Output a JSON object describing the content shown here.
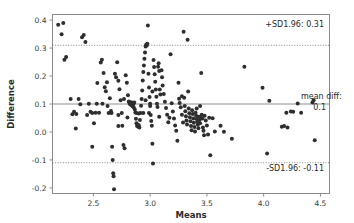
{
  "chart": {
    "type_label": "bland-altman-plot",
    "background": "#ffffff",
    "point_color": "#2e2e2e",
    "line_color": "#8f8f8f"
  },
  "axes": {
    "x_title": "Means",
    "y_title": "Difference",
    "x_ticks": [
      "2.5",
      "3.0",
      "3.5",
      "4.0",
      "4.5"
    ],
    "y_ticks": [
      "0.4",
      "0.3",
      "0.2",
      "0.1",
      "0.0",
      "-0.1",
      "-0.2"
    ]
  },
  "annotations": {
    "upper_limit": "+SD1.96: 0.31",
    "mean_label": "mean diff:",
    "mean_value": "0.1",
    "lower_limit": "-SD1.96: -0.11"
  },
  "chart_data": {
    "type": "scatter",
    "title": "",
    "xlabel": "Means",
    "ylabel": "Difference",
    "xlim": [
      2.14,
      4.58
    ],
    "ylim": [
      -0.22,
      0.42
    ],
    "grid": false,
    "legend": null,
    "xticks": [
      2.5,
      3.0,
      3.5,
      4.0,
      4.5
    ],
    "yticks": [
      0.4,
      0.3,
      0.2,
      0.1,
      0.0,
      -0.1,
      -0.2
    ],
    "reference_lines": [
      {
        "name": "+SD1.96",
        "y": 0.31,
        "style": "dotted",
        "label": "+SD1.96: 0.31"
      },
      {
        "name": "mean diff",
        "y": 0.1,
        "style": "solid",
        "label": "mean diff: 0.1"
      },
      {
        "name": "-SD1.96",
        "y": -0.11,
        "style": "dotted",
        "label": "-SD1.96: -0.11"
      }
    ],
    "marker": "circle",
    "marker_size": 2.0,
    "n_points": 213,
    "points": [
      [
        2.19,
        0.383
      ],
      [
        2.22,
        0.349
      ],
      [
        2.235,
        0.39
      ],
      [
        2.245,
        0.258
      ],
      [
        2.26,
        0.268
      ],
      [
        2.3,
        0.118
      ],
      [
        2.315,
        0.063
      ],
      [
        2.33,
        0.072
      ],
      [
        2.345,
        0.012
      ],
      [
        2.37,
        0.118
      ],
      [
        2.385,
        0.099
      ],
      [
        2.4,
        0.339
      ],
      [
        2.415,
        0.347
      ],
      [
        2.43,
        0.322
      ],
      [
        2.445,
        0.061
      ],
      [
        2.46,
        0.101
      ],
      [
        2.475,
        0.072
      ],
      [
        2.49,
        -0.053
      ],
      [
        2.505,
        0.031
      ],
      [
        2.52,
        0.069
      ],
      [
        2.535,
        0.175
      ],
      [
        2.55,
        0.069
      ],
      [
        2.565,
        0.248
      ],
      [
        2.575,
        0.258
      ],
      [
        2.59,
        0.211
      ],
      [
        2.6,
        0.16
      ],
      [
        2.61,
        0.146
      ],
      [
        2.625,
        0.093
      ],
      [
        2.635,
        0.068
      ],
      [
        2.645,
        0.121
      ],
      [
        2.655,
        0.075
      ],
      [
        2.665,
        -0.053
      ],
      [
        2.67,
        -0.1
      ],
      [
        2.675,
        -0.148
      ],
      [
        2.678,
        -0.158
      ],
      [
        2.682,
        -0.205
      ],
      [
        2.69,
        0.208
      ],
      [
        2.7,
        0.196
      ],
      [
        2.71,
        0.249
      ],
      [
        2.72,
        0.183
      ],
      [
        2.73,
        0.153
      ],
      [
        2.74,
        0.113
      ],
      [
        2.75,
        0.068
      ],
      [
        2.755,
        0.022
      ],
      [
        2.765,
        -0.047
      ],
      [
        2.775,
        -0.058
      ],
      [
        2.785,
        0.203
      ],
      [
        2.795,
        0.176
      ],
      [
        2.805,
        0.131
      ],
      [
        2.812,
        0.109
      ],
      [
        2.818,
        0.104
      ],
      [
        2.822,
        0.101
      ],
      [
        2.826,
        0.098
      ],
      [
        2.83,
        0.102
      ],
      [
        2.833,
        0.106
      ],
      [
        2.836,
        0.097
      ],
      [
        2.839,
        0.1
      ],
      [
        2.842,
        0.094
      ],
      [
        2.845,
        0.103
      ],
      [
        2.848,
        0.091
      ],
      [
        2.851,
        0.099
      ],
      [
        2.855,
        0.088
      ],
      [
        2.86,
        0.105
      ],
      [
        2.865,
        0.08
      ],
      [
        2.87,
        0.07
      ],
      [
        2.875,
        0.047
      ],
      [
        2.88,
        0.031
      ],
      [
        2.885,
        0.021
      ],
      [
        2.89,
        0.026
      ],
      [
        2.895,
        0.019
      ],
      [
        2.9,
        0.024
      ],
      [
        2.905,
        0.016
      ],
      [
        2.91,
        0.043
      ],
      [
        2.915,
        0.068
      ],
      [
        2.92,
        0.094
      ],
      [
        2.925,
        0.118
      ],
      [
        2.93,
        0.148
      ],
      [
        2.935,
        0.184
      ],
      [
        2.94,
        0.214
      ],
      [
        2.945,
        0.238
      ],
      [
        2.95,
        0.262
      ],
      [
        2.955,
        0.284
      ],
      [
        2.96,
        0.306
      ],
      [
        2.965,
        0.312
      ],
      [
        2.97,
        0.309
      ],
      [
        2.975,
        0.315
      ],
      [
        2.98,
        0.381
      ],
      [
        2.985,
        0.208
      ],
      [
        2.99,
        0.159
      ],
      [
        2.995,
        0.125
      ],
      [
        3.0,
        0.093
      ],
      [
        3.005,
        0.061
      ],
      [
        3.01,
        0.039
      ],
      [
        3.015,
        0.022
      ],
      [
        3.02,
        -0.042
      ],
      [
        3.025,
        -0.113
      ],
      [
        3.03,
        0.257
      ],
      [
        3.035,
        0.232
      ],
      [
        3.04,
        0.206
      ],
      [
        3.045,
        0.18
      ],
      [
        3.05,
        0.152
      ],
      [
        3.055,
        0.126
      ],
      [
        3.06,
        0.101
      ],
      [
        3.065,
        0.089
      ],
      [
        3.07,
        0.233
      ],
      [
        3.075,
        0.246
      ],
      [
        3.08,
        0.218
      ],
      [
        3.085,
        0.152
      ],
      [
        3.09,
        0.134
      ],
      [
        3.1,
        0.221
      ],
      [
        3.105,
        0.196
      ],
      [
        3.11,
        0.166
      ],
      [
        3.12,
        0.136
      ],
      [
        3.13,
        0.108
      ],
      [
        3.14,
        0.086
      ],
      [
        3.15,
        0.062
      ],
      [
        3.16,
        0.035
      ],
      [
        3.17,
        0.051
      ],
      [
        3.18,
        0.278
      ],
      [
        3.19,
        0.103
      ],
      [
        3.2,
        0.073
      ],
      [
        3.21,
        0.048
      ],
      [
        3.22,
        0.023
      ],
      [
        3.23,
        0.004
      ],
      [
        3.24,
        -0.031
      ],
      [
        3.25,
        0.176
      ],
      [
        3.255,
        0.119
      ],
      [
        3.26,
        0.104
      ],
      [
        3.27,
        0.088
      ],
      [
        3.28,
        0.062
      ],
      [
        3.29,
        0.034
      ],
      [
        3.295,
        0.358
      ],
      [
        3.3,
        0.122
      ],
      [
        3.305,
        0.093
      ],
      [
        3.31,
        0.074
      ],
      [
        3.315,
        0.056
      ],
      [
        3.32,
        0.041
      ],
      [
        3.325,
        0.027
      ],
      [
        3.33,
        0.33
      ],
      [
        3.335,
        0.145
      ],
      [
        3.34,
        0.084
      ],
      [
        3.345,
        0.067
      ],
      [
        3.35,
        0.053
      ],
      [
        3.355,
        0.038
      ],
      [
        3.36,
        0.021
      ],
      [
        3.365,
        0.006
      ],
      [
        3.37,
        0.078
      ],
      [
        3.375,
        0.064
      ],
      [
        3.38,
        0.048
      ],
      [
        3.385,
        0.033
      ],
      [
        3.39,
        0.018
      ],
      [
        3.395,
        0.002
      ],
      [
        3.4,
        0.069
      ],
      [
        3.405,
        0.058
      ],
      [
        3.41,
        0.046
      ],
      [
        3.415,
        0.036
      ],
      [
        3.42,
        0.026
      ],
      [
        3.425,
        0.013
      ],
      [
        3.43,
        0.054
      ],
      [
        3.435,
        0.043
      ],
      [
        3.44,
        0.031
      ],
      [
        3.445,
        0.052
      ],
      [
        3.45,
        0.211
      ],
      [
        3.455,
        0.062
      ],
      [
        3.46,
        0.048
      ],
      [
        3.465,
        0.016
      ],
      [
        3.47,
        0.004
      ],
      [
        3.475,
        -0.012
      ],
      [
        3.48,
        0.058
      ],
      [
        3.49,
        0.041
      ],
      [
        3.5,
        0.023
      ],
      [
        3.51,
        -0.009
      ],
      [
        3.52,
        0.051
      ],
      [
        3.53,
        -0.083
      ],
      [
        3.55,
        0.049
      ],
      [
        3.57,
        0.002
      ],
      [
        3.62,
        0.022
      ],
      [
        3.65,
        0.001
      ],
      [
        3.72,
        -0.024
      ],
      [
        3.83,
        0.233
      ],
      [
        3.99,
        0.158
      ],
      [
        4.03,
        -0.077
      ],
      [
        4.05,
        0.112
      ],
      [
        4.16,
        0.019
      ],
      [
        4.18,
        0.021
      ],
      [
        4.21,
        0.016
      ],
      [
        4.2,
        0.069
      ],
      [
        4.24,
        0.073
      ],
      [
        4.26,
        0.072
      ],
      [
        4.3,
        0.102
      ],
      [
        4.33,
        0.069
      ],
      [
        4.43,
        0.105
      ],
      [
        4.44,
        0.113
      ],
      [
        4.45,
        -0.03
      ],
      [
        2.53,
        0.101
      ],
      [
        2.58,
        0.101
      ],
      [
        2.83,
        0.101
      ],
      [
        3.0,
        0.101
      ],
      [
        2.88,
        0.068
      ],
      [
        2.9,
        0.066
      ],
      [
        3.02,
        0.145
      ],
      [
        2.77,
        0.118
      ],
      [
        2.49,
        0.068
      ],
      [
        2.35,
        0.064
      ],
      [
        2.62,
        0.178
      ],
      [
        2.72,
        0.061
      ],
      [
        2.96,
        0.113
      ],
      [
        3.08,
        0.054
      ],
      [
        2.66,
        0.068
      ],
      [
        2.94,
        0.068
      ],
      [
        2.8,
        0.052
      ],
      [
        3.28,
        0.128
      ],
      [
        3.44,
        0.093
      ],
      [
        3.41,
        0.084
      ],
      [
        2.72,
        0.021
      ],
      [
        2.99,
        0.068
      ]
    ]
  }
}
